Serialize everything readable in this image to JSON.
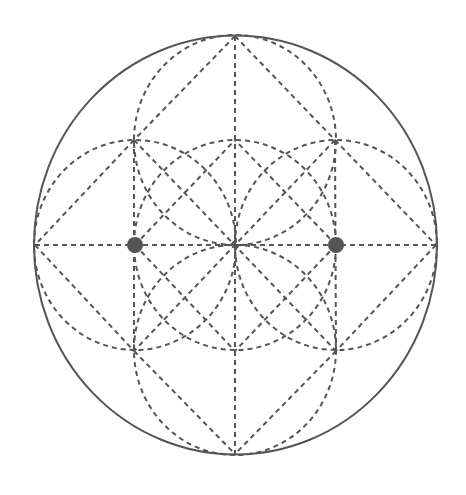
{
  "diagram": {
    "title": "",
    "colors": {
      "line": "#555555",
      "background": "#ffffff"
    },
    "outer_circle": {
      "cx": 235.5,
      "cy": 245,
      "rx": 201.5,
      "ry": 209.5
    },
    "center": {
      "x": 235,
      "y": 245
    },
    "vertices": {
      "top": {
        "x": 235,
        "y": 36
      },
      "bottom": {
        "x": 235,
        "y": 454
      },
      "left": {
        "x": 35,
        "y": 245
      },
      "right": {
        "x": 436,
        "y": 245
      },
      "upper_left": {
        "x": 134,
        "y": 140
      },
      "upper_right": {
        "x": 335,
        "y": 140
      },
      "lower_left": {
        "x": 134,
        "y": 351
      },
      "lower_right": {
        "x": 336,
        "y": 351
      },
      "inner_top": {
        "x": 235,
        "y": 140
      },
      "inner_bottom": {
        "x": 235,
        "y": 351
      }
    },
    "dashed_circles": [
      {
        "name": "center-circle",
        "cx": 235,
        "cy": 245,
        "rx": 101,
        "ry": 105
      },
      {
        "name": "left-circle",
        "cx": 135,
        "cy": 245,
        "rx": 101,
        "ry": 105
      },
      {
        "name": "right-circle",
        "cx": 336,
        "cy": 245,
        "rx": 101,
        "ry": 105
      },
      {
        "name": "top-circle",
        "cx": 235,
        "cy": 140,
        "rx": 101,
        "ry": 105
      },
      {
        "name": "bottom-circle",
        "cx": 235,
        "cy": 350,
        "rx": 101,
        "ry": 105
      }
    ],
    "dashed_lines": [
      {
        "name": "horizontal-diameter",
        "x1": 35,
        "y1": 245,
        "x2": 436,
        "y2": 245
      },
      {
        "name": "vertical-diameter",
        "x1": 235,
        "y1": 36,
        "x2": 235,
        "y2": 454
      },
      {
        "name": "octagon-top-ul",
        "x1": 235,
        "y1": 36,
        "x2": 134,
        "y2": 140
      },
      {
        "name": "octagon-top-ur",
        "x1": 235,
        "y1": 36,
        "x2": 335,
        "y2": 140
      },
      {
        "name": "octagon-ul-left",
        "x1": 134,
        "y1": 140,
        "x2": 35,
        "y2": 245
      },
      {
        "name": "octagon-ur-right",
        "x1": 335,
        "y1": 140,
        "x2": 436,
        "y2": 245
      },
      {
        "name": "octagon-left-ll",
        "x1": 35,
        "y1": 245,
        "x2": 134,
        "y2": 351
      },
      {
        "name": "octagon-right-lr",
        "x1": 436,
        "y1": 245,
        "x2": 336,
        "y2": 351
      },
      {
        "name": "octagon-ll-bottom",
        "x1": 134,
        "y1": 351,
        "x2": 235,
        "y2": 454
      },
      {
        "name": "octagon-lr-bottom",
        "x1": 336,
        "y1": 351,
        "x2": 235,
        "y2": 454
      },
      {
        "name": "diagonal-ul-lr",
        "x1": 134,
        "y1": 140,
        "x2": 336,
        "y2": 351
      },
      {
        "name": "diagonal-ur-ll",
        "x1": 335,
        "y1": 140,
        "x2": 134,
        "y2": 351
      },
      {
        "name": "left-dot-inner-top",
        "x1": 135,
        "y1": 245,
        "x2": 235,
        "y2": 140
      },
      {
        "name": "left-dot-inner-bottom",
        "x1": 135,
        "y1": 245,
        "x2": 235,
        "y2": 351
      },
      {
        "name": "right-dot-inner-top",
        "x1": 336,
        "y1": 245,
        "x2": 235,
        "y2": 140
      },
      {
        "name": "right-dot-inner-bottom",
        "x1": 336,
        "y1": 245,
        "x2": 235,
        "y2": 351
      },
      {
        "name": "left-dot-vertical",
        "x1": 134,
        "y1": 140,
        "x2": 134,
        "y2": 351
      },
      {
        "name": "right-dot-vertical",
        "x1": 335,
        "y1": 140,
        "x2": 336,
        "y2": 351
      }
    ],
    "points": [
      {
        "name": "left-focus-dot",
        "cx": 135,
        "cy": 245,
        "r": 8
      },
      {
        "name": "right-focus-dot",
        "cx": 336,
        "cy": 245,
        "r": 8
      }
    ],
    "center_marker": {
      "cx": 235,
      "cy": 245,
      "r": 3
    }
  }
}
